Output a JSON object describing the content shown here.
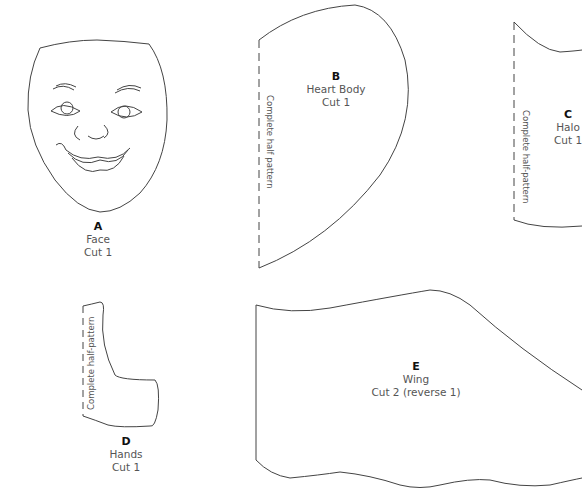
{
  "pieces": [
    {
      "letter": "A",
      "name": "Face",
      "cut": "Cut 1"
    },
    {
      "letter": "B",
      "name": "Heart Body",
      "cut": "Cut 1",
      "fold_note": "Complete half pattern"
    },
    {
      "letter": "C",
      "name": "Halo",
      "cut": "Cut 1",
      "fold_note": "Complete half-pattern"
    },
    {
      "letter": "D",
      "name": "Hands",
      "cut": "Cut 1",
      "fold_note": "Complete half-pattern"
    },
    {
      "letter": "E",
      "name": "Wing",
      "cut": "Cut 2 (reverse 1)"
    }
  ],
  "colors": {
    "outline": "#444444",
    "label": "#555555",
    "letter": "#111111"
  }
}
